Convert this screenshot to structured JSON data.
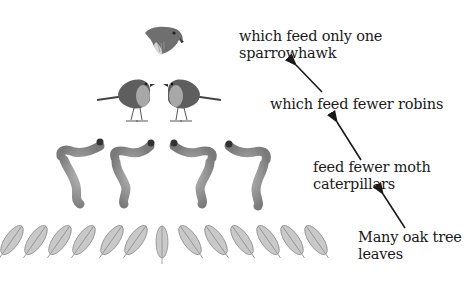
{
  "labels": {
    "sparrowhawk": [
      "which feed only one",
      "sparrowhawk"
    ],
    "robins": [
      "which feed fewer robins"
    ],
    "caterpillars": [
      "feed fewer moth",
      "caterpillars"
    ],
    "leaves": [
      "Many oak tree",
      "leaves"
    ]
  },
  "levels": [
    {
      "name": "sparrowhawk",
      "count": 1
    },
    {
      "name": "robin",
      "count": 2
    },
    {
      "name": "moth caterpillar",
      "count": 4
    },
    {
      "name": "oak leaf",
      "count": 14
    }
  ],
  "colors": {
    "text": "#1a1a1a",
    "arrow": "#1a1a1a",
    "illustration": "#8a8a8a"
  }
}
